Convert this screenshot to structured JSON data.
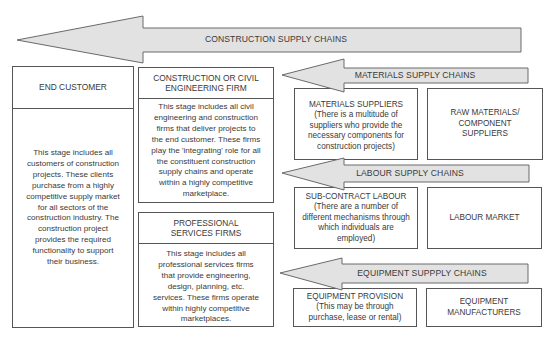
{
  "diagram": {
    "main_arrow": {
      "label": "CONSTRUCTION SUPPLY CHAINS"
    },
    "end_customer": {
      "title": "END CUSTOMER",
      "body": "This stage includes all\ncustomers of construction\nprojects. These clients\npurchase from a highly\ncompetitive supply market\nfor all sectors of the\nconstruction industry. The\nconstruction project\nprovides the required\nfunctionality to support\ntheir business."
    },
    "construction_firm": {
      "title": "CONSTRUCTION OR CIVIL\nENGINEERING FIRM",
      "body": "This stage includes all civil\nengineering and construction\nfirms that deliver projects to\nthe end customer. These firms\nplay the 'integrating' role for all\nthe constituent construction\nsupply chains and operate\nwithin a highly competitive\nmarketplace."
    },
    "professional_services": {
      "title": "PROFESSIONAL\nSERVICES FIRMS",
      "body": "This stage includes all\nprofessional services firms\nthat provide engineering,\ndesign, planning, etc.\nservices. These firms operate\nwithin highly competitive\nmarketplaces."
    },
    "materials_chain": {
      "arrow_label": "MATERIALS SUPPLY CHAINS",
      "supplier": "MATERIALS SUPPLIERS\n(There is a multitude of\nsuppliers who provide the\nnecessary components for\nconstruction projects)",
      "upstream": "RAW MATERIALS/\nCOMPONENT\nSUPPLIERS"
    },
    "labour_chain": {
      "arrow_label": "LABOUR SUPPLY CHAINS",
      "supplier": "SUB-CONTRACT LABOUR\n(There are a number of\ndifferent mechanisms through\nwhich individuals are\nemployed)",
      "upstream": "LABOUR MARKET"
    },
    "equipment_chain": {
      "arrow_label": "EQUIPMENT SUPPPLY CHAINS",
      "supplier": "EQUIPMENT PROVISION\n(This may be through\npurchase, lease or rental)",
      "upstream": "EQUIPMENT\nMANUFACTURERS"
    }
  },
  "colors": {
    "arrow_fill": "#e2e2e2",
    "arrow_stroke": "#6a6a6a",
    "box_border": "#555555",
    "text": "#3a3a3a",
    "background": "#ffffff"
  }
}
